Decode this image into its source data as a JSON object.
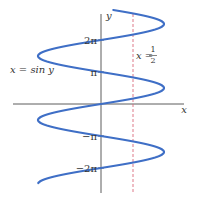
{
  "diagram": {
    "title": "",
    "colors": {
      "curve": "#3f6fc6",
      "axis": "#333333",
      "dashed_line": "#d96a7a",
      "background": "#ffffff"
    },
    "axes": {
      "x_label": "x",
      "y_label": "y",
      "y_ticks": [
        {
          "label": "2π",
          "value": "2pi"
        },
        {
          "label": "π",
          "value": "pi"
        },
        {
          "label": "−π",
          "value": "-pi"
        },
        {
          "label": "−2π",
          "value": "-2pi"
        }
      ]
    },
    "curve_label": "x = sin y",
    "line_label": {
      "prefix": "x =",
      "numerator": "1",
      "denominator": "2"
    }
  }
}
